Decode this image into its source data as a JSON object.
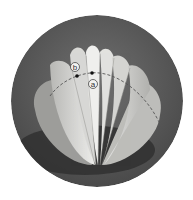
{
  "figure": {
    "colors": {
      "background": "#ffffff",
      "circle": "#5a5a5a",
      "shadow": "#2e2e2e",
      "paper_light": "#e8e8e6",
      "paper_mid": "#c9c9c6",
      "paper_dark": "#a3a3a0",
      "dashed_line": "#555555",
      "marker": "#111111"
    },
    "annotations": [
      {
        "id": "a",
        "label": "a",
        "point": [
          92,
          73
        ],
        "label_pos": [
          93,
          84
        ]
      },
      {
        "id": "b",
        "label": "b",
        "point": [
          77,
          76
        ],
        "label_pos": [
          75,
          67
        ]
      }
    ]
  }
}
